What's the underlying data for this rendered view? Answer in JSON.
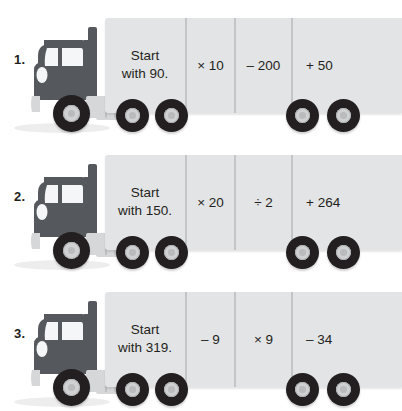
{
  "worksheet": {
    "title": "Truck function machines",
    "background_color": "#ffffff",
    "trailer_color": "#e3e4e5",
    "cab_color": "#55585c",
    "divider_color": "#c3c5c7",
    "tire_color": "#231f20",
    "hub_color": "#cfd1d2"
  },
  "problems": [
    {
      "number": "1.",
      "start": "Start\nwith 90.",
      "start_line1": "Start",
      "start_line2": "with 90.",
      "op1": "× 10",
      "op2": "– 200",
      "op3": "+ 50"
    },
    {
      "number": "2.",
      "start": "Start\nwith 150.",
      "start_line1": "Start",
      "start_line2": "with 150.",
      "op1": "× 20",
      "op2": "÷ 2",
      "op3": "+ 264"
    },
    {
      "number": "3.",
      "start": "Start\nwith 319.",
      "start_line1": "Start",
      "start_line2": "with 319.",
      "op1": "– 9",
      "op2": "× 9",
      "op3": "– 34"
    }
  ],
  "icons": {
    "truck": "truck-icon",
    "wheel": "wheel-icon",
    "exhaust": "exhaust-stack-icon",
    "headlight": "headlight-icon"
  }
}
